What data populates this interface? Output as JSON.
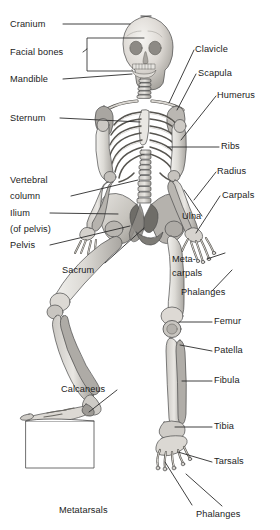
{
  "figure": {
    "view": "anterior, seated with left foot resting on a block",
    "colors": {
      "bone_light": "#eceae6",
      "bone_mid": "#c9c6c0",
      "bone_dark": "#9d9a94",
      "bone_shadow": "#7d7b76",
      "outline": "#4a4a4a",
      "leader_line": "#2b2b2b",
      "text": "#1b1b1b",
      "background": "#ffffff",
      "block_fill": "#ffffff"
    }
  },
  "labels": {
    "left": [
      {
        "key": "cranium",
        "text": "Cranium"
      },
      {
        "key": "facial_bones",
        "text": "Facial bones"
      },
      {
        "key": "mandible",
        "text": "Mandible"
      },
      {
        "key": "sternum",
        "text": "Sternum"
      },
      {
        "key": "vertebral_column_1",
        "text": "Vertebral"
      },
      {
        "key": "vertebral_column_2",
        "text": "column"
      },
      {
        "key": "ilium_1",
        "text": "Ilium"
      },
      {
        "key": "ilium_2",
        "text": "(of pelvis)"
      },
      {
        "key": "pelvis",
        "text": "Pelvis"
      },
      {
        "key": "sacrum",
        "text": "Sacrum"
      },
      {
        "key": "calcaneus",
        "text": "Calcaneus"
      },
      {
        "key": "metatarsals",
        "text": "Metatarsals"
      }
    ],
    "right": [
      {
        "key": "clavicle",
        "text": "Clavicle"
      },
      {
        "key": "scapula",
        "text": "Scapula"
      },
      {
        "key": "humerus",
        "text": "Humerus"
      },
      {
        "key": "ribs",
        "text": "Ribs"
      },
      {
        "key": "radius",
        "text": "Radius"
      },
      {
        "key": "carpals",
        "text": "Carpals"
      },
      {
        "key": "ulna",
        "text": "Ulna"
      },
      {
        "key": "metacarpals_1",
        "text": "Meta-"
      },
      {
        "key": "metacarpals_2",
        "text": "carpals"
      },
      {
        "key": "phalanges_hand",
        "text": "Phalanges"
      },
      {
        "key": "femur",
        "text": "Femur"
      },
      {
        "key": "patella",
        "text": "Patella"
      },
      {
        "key": "fibula",
        "text": "Fibula"
      },
      {
        "key": "tibia",
        "text": "Tibia"
      },
      {
        "key": "tarsals",
        "text": "Tarsals"
      },
      {
        "key": "phalanges_foot",
        "text": "Phalanges"
      }
    ]
  }
}
